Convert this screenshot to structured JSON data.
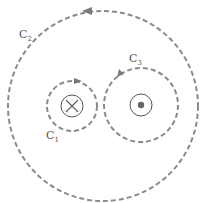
{
  "diagram": {
    "type": "amperian-loops-around-currents",
    "loops": [
      {
        "id": "C1",
        "label": "C",
        "subscript": "1",
        "encloses": "current-into-page",
        "direction": "clockwise"
      },
      {
        "id": "C2",
        "label": "C",
        "subscript": "2",
        "encloses": "both-currents",
        "direction": "counterclockwise"
      },
      {
        "id": "C3",
        "label": "C",
        "subscript": "3",
        "encloses": "current-out-of-page",
        "direction": "counterclockwise"
      }
    ],
    "currents": [
      {
        "symbol": "cross",
        "meaning": "into-page"
      },
      {
        "symbol": "dot",
        "meaning": "out-of-page"
      }
    ],
    "colors": {
      "loop_stroke": "#8a8a8a",
      "wire_stroke": "#555555",
      "label": "#555555"
    }
  }
}
